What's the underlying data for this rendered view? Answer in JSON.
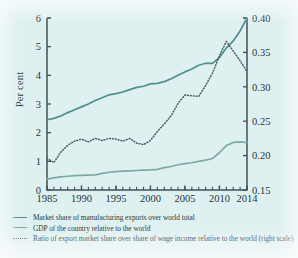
{
  "figure": {
    "background_color": "#dff0f1",
    "left_axis_title": "Per cent"
  },
  "axes": {
    "left_ticks": [
      "0",
      "1",
      "2",
      "3",
      "4",
      "5",
      "6"
    ],
    "right_ticks": [
      "0.15",
      "0.20",
      "0.25",
      "0.30",
      "0.35",
      "0.40"
    ],
    "x_ticks": [
      "1985",
      "1990",
      "1995",
      "2000",
      "2005",
      "2010",
      "2014"
    ]
  },
  "legend": {
    "items": [
      {
        "marker": "solid-line-marker",
        "label": "Market share of manufacturing exports over world total",
        "color": "#4f8f8f"
      },
      {
        "marker": "solid-line-marker",
        "label": "GDP of the country relative to the world",
        "color": "#7fa9a4"
      },
      {
        "marker": "dotted-line-marker",
        "label": "Ratio of export market share over share of wage income relative to the world (right scale)",
        "color": "#4a5d63"
      }
    ]
  },
  "chart_data": {
    "type": "line",
    "title": "",
    "xlabel": "",
    "ylabel": "Per cent",
    "y2label": "",
    "xlim": [
      1985,
      2014
    ],
    "ylim": [
      0,
      6
    ],
    "y2lim": [
      0.15,
      0.4
    ],
    "grid": false,
    "legend_position": "below",
    "x": [
      1985,
      1986,
      1987,
      1988,
      1989,
      1990,
      1991,
      1992,
      1993,
      1994,
      1995,
      1996,
      1997,
      1998,
      1999,
      2000,
      2001,
      2002,
      2003,
      2004,
      2005,
      2006,
      2007,
      2008,
      2009,
      2010,
      2011,
      2012,
      2013,
      2014
    ],
    "series": [
      {
        "name": "Market share of manufacturing exports over world total",
        "axis": "left",
        "style": "solid",
        "color": "#4f8f8f",
        "values": [
          2.45,
          2.5,
          2.58,
          2.7,
          2.8,
          2.9,
          3.0,
          3.12,
          3.22,
          3.32,
          3.36,
          3.42,
          3.5,
          3.58,
          3.62,
          3.7,
          3.72,
          3.78,
          3.88,
          4.0,
          4.12,
          4.22,
          4.35,
          4.42,
          4.42,
          4.62,
          4.95,
          5.2,
          5.55,
          6.0
        ]
      },
      {
        "name": "GDP of the country relative to the world",
        "axis": "left",
        "style": "solid",
        "color": "#7fa9a4",
        "values": [
          0.38,
          0.42,
          0.46,
          0.48,
          0.5,
          0.51,
          0.52,
          0.53,
          0.58,
          0.62,
          0.64,
          0.66,
          0.67,
          0.68,
          0.69,
          0.7,
          0.72,
          0.78,
          0.82,
          0.88,
          0.92,
          0.95,
          1.0,
          1.04,
          1.1,
          1.3,
          1.55,
          1.66,
          1.68,
          1.65
        ]
      },
      {
        "name": "Ratio of export market share over share of wage income relative to the world (right scale)",
        "axis": "right",
        "style": "dotted",
        "color": "#4a5d63",
        "values": [
          0.196,
          0.19,
          0.205,
          0.215,
          0.221,
          0.224,
          0.22,
          0.225,
          0.222,
          0.225,
          0.224,
          0.221,
          0.225,
          0.218,
          0.216,
          0.222,
          0.235,
          0.246,
          0.258,
          0.276,
          0.288,
          0.287,
          0.286,
          0.302,
          0.32,
          0.345,
          0.366,
          0.352,
          0.338,
          0.322
        ]
      }
    ]
  }
}
